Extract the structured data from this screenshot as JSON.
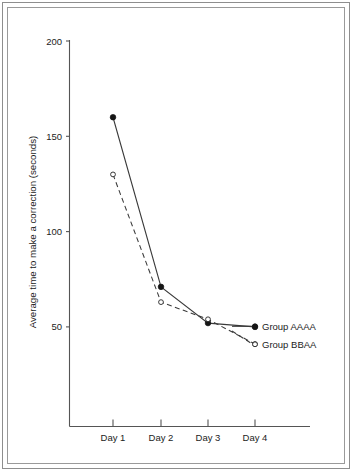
{
  "figure": {
    "background_color": "#ffffff",
    "frame_color": "#8e8e8e",
    "line_color": "#3a3a3a"
  },
  "chart_data": {
    "type": "line",
    "title": "",
    "xlabel": "",
    "ylabel": "Average time to make a correction (seconds)",
    "categories": [
      "Day 1",
      "Day 2",
      "Day 3",
      "Day 4"
    ],
    "ylim": [
      0,
      200
    ],
    "yticks": [
      50,
      100,
      150,
      200
    ],
    "ytick_labels": [
      "50",
      "100",
      "150",
      "200"
    ],
    "grid": false,
    "legend_position": "right-inline",
    "series": [
      {
        "name": "Group AAAA",
        "values": [
          160,
          71,
          52,
          50
        ],
        "marker": "filled-circle",
        "linestyle": "solid"
      },
      {
        "name": "Group BBAA",
        "values": [
          130,
          63,
          54,
          41
        ],
        "marker": "open-circle",
        "linestyle": "dashed"
      }
    ]
  },
  "legend": {
    "items": [
      {
        "label": "Group AAAA",
        "marker": "filled-circle"
      },
      {
        "label": "Group BBAA",
        "marker": "open-circle"
      }
    ]
  },
  "axis": {
    "y_tick_0": "200",
    "y_tick_1": "150",
    "y_tick_2": "100",
    "y_tick_3": "50",
    "y_title": "Average time to make a correction (seconds)",
    "x_cat_0": "Day 1",
    "x_cat_1": "Day 2",
    "x_cat_2": "Day 3",
    "x_cat_3": "Day 4"
  }
}
